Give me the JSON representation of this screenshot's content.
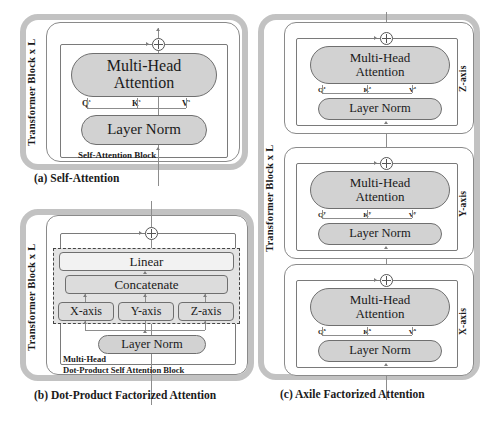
{
  "figure": {
    "colors": {
      "outer_frame": "#c2c2c2",
      "module_fill": "#d2d2d2",
      "dashed_fill": "#e3e3e3",
      "line": "#8d8d8d",
      "text": "#1a1a1a"
    }
  },
  "panel_a": {
    "caption": "(a) Self-Attention",
    "side_label": "Transformer Block x L",
    "block_label": "Self-Attention Block",
    "modules": {
      "attention": "Multi-Head\nAttention",
      "attention_line1": "Multi-Head",
      "attention_line2": "Attention",
      "layer_norm": "Layer Norm"
    },
    "qkv": {
      "q": "Q",
      "k": "K",
      "v": "V",
      "sup": "s"
    },
    "residual_symbol": "+"
  },
  "panel_b": {
    "caption": "(b) Dot-Product Factorized Attention",
    "side_label": "Transformer Block x L",
    "block_label_line1": "Multi-Head",
    "block_label_line2": "Dot-Product Self Attention Block",
    "modules": {
      "linear": "Linear",
      "concatenate": "Concatenate",
      "axes": [
        "X-axis",
        "Y-axis",
        "Z-axis"
      ],
      "layer_norm": "Layer Norm"
    },
    "residual_symbol": "+"
  },
  "panel_c": {
    "caption": "(c) Axile Factorized Attention",
    "side_label": "Transformer Block x L",
    "blocks": [
      {
        "axis_label": "Z-axis",
        "attention_line1": "Multi-Head",
        "attention_line2": "Attention",
        "layer_norm": "Layer Norm",
        "qkv": {
          "q": "Q",
          "k": "K",
          "v": "V",
          "sup": "z"
        },
        "residual_symbol": "+"
      },
      {
        "axis_label": "Y-axis",
        "attention_line1": "Multi-Head",
        "attention_line2": "Attention",
        "layer_norm": "Layer Norm",
        "qkv": {
          "q": "Q",
          "k": "K",
          "v": "V",
          "sup": "y"
        },
        "residual_symbol": "+"
      },
      {
        "axis_label": "X-axis",
        "attention_line1": "Multi-Head",
        "attention_line2": "Attention",
        "layer_norm": "Layer Norm",
        "qkv": {
          "q": "Q",
          "k": "K",
          "v": "V",
          "sup": "x"
        },
        "residual_symbol": "+"
      }
    ]
  }
}
